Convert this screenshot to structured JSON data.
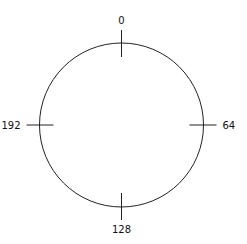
{
  "diagram": {
    "type": "circular-dial",
    "range_max": 256,
    "ticks": [
      {
        "value": 0,
        "label": "0",
        "position": "top"
      },
      {
        "value": 64,
        "label": "64",
        "position": "right"
      },
      {
        "value": 128,
        "label": "128",
        "position": "bottom"
      },
      {
        "value": 192,
        "label": "192",
        "position": "left"
      }
    ],
    "colors": {
      "stroke": "#222222",
      "background": "#ffffff"
    }
  }
}
